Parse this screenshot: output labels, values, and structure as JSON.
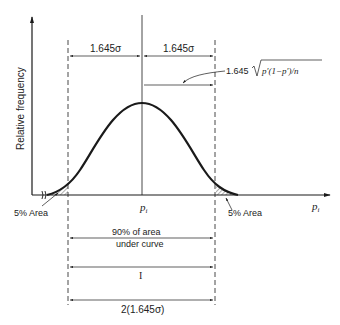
{
  "diagram": {
    "type": "normal-distribution-confidence-interval",
    "y_axis_label": "Relative frequency",
    "x_axis_label": "p",
    "x_axis_label_subscript": "i",
    "center_label": "p",
    "center_label_subscript": "i",
    "top_left_dimension": "1.645σ",
    "top_right_dimension": "1.645σ",
    "formula_prefix": "1.645",
    "formula_radicand": "p′(1−p′)/n",
    "left_tail_label": "5% Area",
    "right_tail_label": "5% Area",
    "dim1_line1": "90% of area",
    "dim1_line2": "under curve",
    "dim2_label": "I",
    "dim3_label": "2(1.645σ)"
  },
  "colors": {
    "ink": "#1a1a1a",
    "background": "#ffffff"
  }
}
